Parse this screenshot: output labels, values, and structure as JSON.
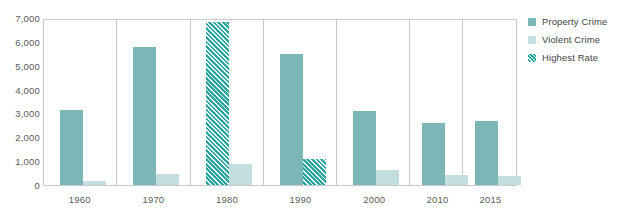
{
  "chart_data": {
    "type": "bar",
    "title": "",
    "subtitle": "",
    "xlabel": "",
    "ylabel": "",
    "categories": [
      "1960",
      "1970",
      "1980",
      "1990",
      "2000",
      "2010",
      "2015"
    ],
    "ylim": [
      0,
      7000
    ],
    "yticks": [
      0,
      1000,
      2000,
      3000,
      4000,
      5000,
      6000,
      7000
    ],
    "ytick_labels": [
      "0",
      "1,000",
      "2,000",
      "3,000",
      "4,000",
      "5,000",
      "6,000",
      "7,000"
    ],
    "grid": false,
    "legend_position": "right",
    "series": [
      {
        "name": "Property Crime",
        "color": "#7db6b6",
        "values": [
          3190,
          5870,
          6900,
          5540,
          3120,
          2650,
          2700
        ],
        "highest_rate_flags": [
          false,
          false,
          true,
          false,
          false,
          false,
          false
        ]
      },
      {
        "name": "Violent Crime",
        "color": "#c2dede",
        "values": [
          160,
          470,
          900,
          1100,
          640,
          420,
          400
        ],
        "highest_rate_flags": [
          false,
          false,
          false,
          true,
          false,
          false,
          false
        ]
      }
    ],
    "highest_rate": {
      "name": "Highest Rate",
      "pattern": "diagonal-hatch",
      "color": "#2aa5a0"
    }
  },
  "legend": {
    "items": [
      {
        "label": "Property Crime",
        "swatch": "property"
      },
      {
        "label": "Violent Crime",
        "swatch": "violent"
      },
      {
        "label": "Highest Rate",
        "swatch": "hatch"
      }
    ]
  }
}
